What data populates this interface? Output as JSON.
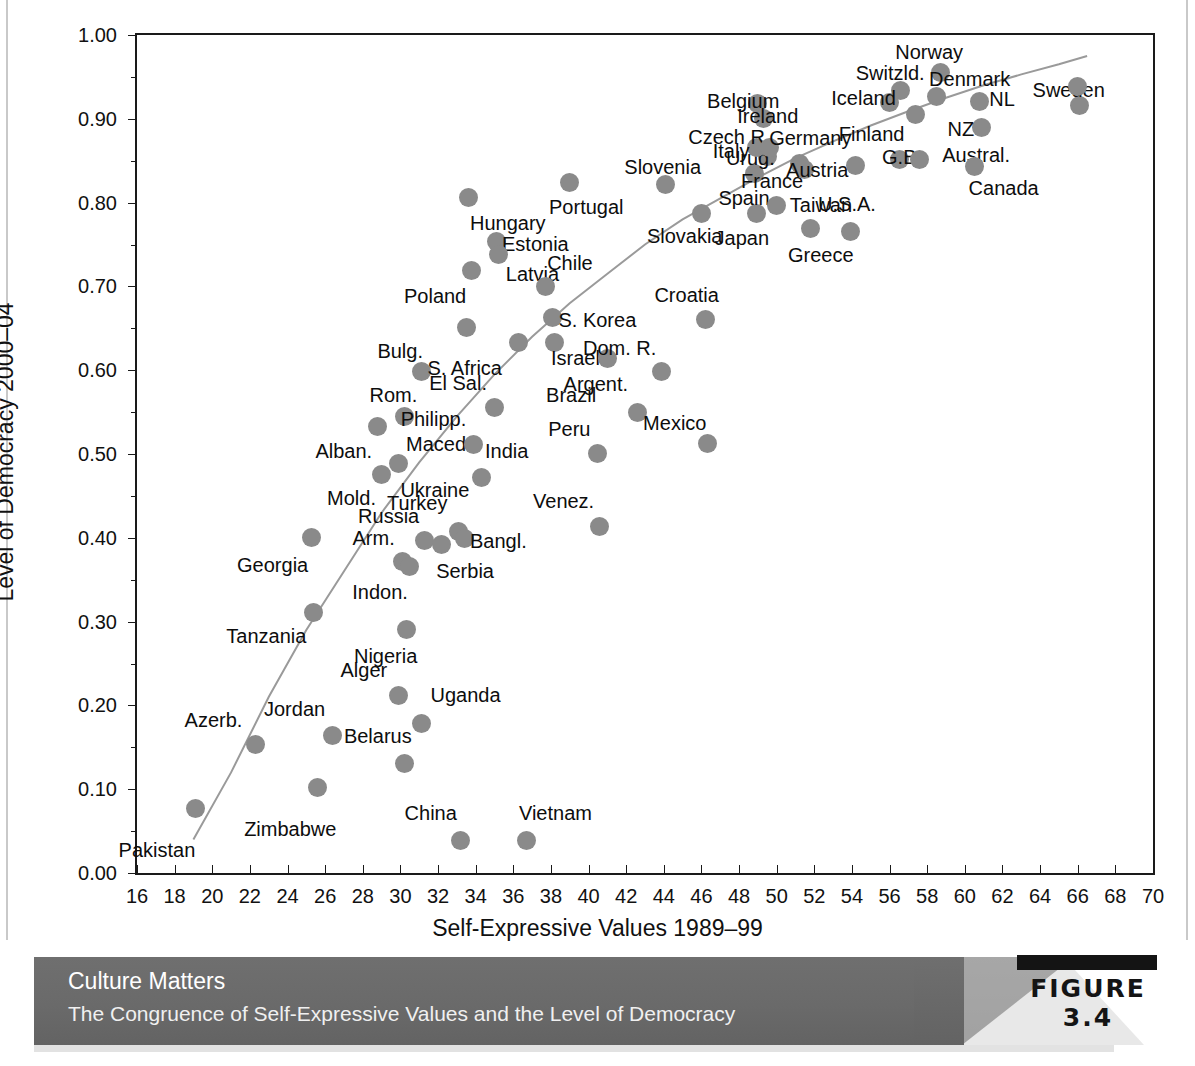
{
  "figure": {
    "tag_label": "FIGURE 3.4",
    "banner_title": "Culture Matters",
    "banner_subtitle": "The Congruence of Self-Expressive Values and the Level of Democracy"
  },
  "colors": {
    "marker": "#8a8a8a",
    "axis": "#1a1a1a",
    "trend": "#9a9a9a",
    "banner": "#6a6a6a",
    "banner_text": "#ffffff"
  },
  "chart_data": {
    "type": "scatter",
    "title": "The Congruence of Self-Expressive Values and the Level of Democracy",
    "xlabel": "Self-Expressive Values 1989–99",
    "ylabel": "Level of Democracy 2000–04",
    "xlim": [
      16,
      70
    ],
    "ylim": [
      0.0,
      1.0
    ],
    "grid": false,
    "legend": "none",
    "x_ticks": [
      16,
      18,
      20,
      22,
      24,
      26,
      28,
      30,
      32,
      34,
      36,
      38,
      40,
      42,
      44,
      46,
      48,
      50,
      52,
      54,
      56,
      58,
      60,
      62,
      64,
      66,
      68,
      70
    ],
    "x_tick_labels": [
      "16",
      "18",
      "20",
      "22",
      "24",
      "26",
      "28",
      "30",
      "32",
      "34",
      "36",
      "38",
      "40",
      "42",
      "44",
      "46",
      "48",
      "50",
      "52",
      "54",
      "56",
      "58",
      "60",
      "62",
      "64",
      "66",
      "68",
      "70"
    ],
    "y_ticks": [
      0.0,
      0.1,
      0.2,
      0.3,
      0.4,
      0.5,
      0.6,
      0.7,
      0.8,
      0.9,
      1.0
    ],
    "y_tick_labels": [
      "0.00",
      "0.10",
      "0.20",
      "0.30",
      "0.40",
      "0.50",
      "0.60",
      "0.70",
      "0.80",
      "0.90",
      "1.00"
    ],
    "y_minor_ticks": [
      0.05,
      0.15,
      0.25,
      0.35,
      0.45,
      0.55,
      0.65,
      0.75,
      0.85,
      0.95
    ],
    "trend_line": {
      "type": "logarithmic-fit",
      "points": [
        [
          19.0,
          0.04
        ],
        [
          21.0,
          0.12
        ],
        [
          23.0,
          0.21
        ],
        [
          25.0,
          0.29
        ],
        [
          27.0,
          0.36
        ],
        [
          29.0,
          0.43
        ],
        [
          31.0,
          0.49
        ],
        [
          33.0,
          0.545
        ],
        [
          35.0,
          0.595
        ],
        [
          37.0,
          0.64
        ],
        [
          39.0,
          0.68
        ],
        [
          41.0,
          0.715
        ],
        [
          43.0,
          0.75
        ],
        [
          45.0,
          0.78
        ],
        [
          47.0,
          0.805
        ],
        [
          49.0,
          0.83
        ],
        [
          51.0,
          0.853
        ],
        [
          53.0,
          0.873
        ],
        [
          55.0,
          0.892
        ],
        [
          57.0,
          0.909
        ],
        [
          59.0,
          0.925
        ],
        [
          61.0,
          0.94
        ],
        [
          63.0,
          0.953
        ],
        [
          65.0,
          0.965
        ],
        [
          66.5,
          0.975
        ]
      ]
    },
    "points": [
      {
        "label": "Pakistan",
        "x": 19.1,
        "y": 0.077,
        "lx": 19.1,
        "ly": 0.028,
        "anchor": "r"
      },
      {
        "label": "Azerb.",
        "x": 22.3,
        "y": 0.153,
        "lx": 21.6,
        "ly": 0.183,
        "anchor": "r"
      },
      {
        "label": "Tanzania",
        "x": 25.4,
        "y": 0.311,
        "lx": 25.0,
        "ly": 0.283,
        "anchor": "r"
      },
      {
        "label": "Zimbabwe",
        "x": 25.6,
        "y": 0.102,
        "lx": 26.6,
        "ly": 0.052,
        "anchor": "r"
      },
      {
        "label": "Jordan",
        "x": 26.4,
        "y": 0.164,
        "lx": 26.0,
        "ly": 0.196,
        "anchor": "r"
      },
      {
        "label": "Alger",
        "x": 29.9,
        "y": 0.212,
        "lx": 29.3,
        "ly": 0.242,
        "anchor": "r"
      },
      {
        "label": "Nigeria",
        "x": 30.3,
        "y": 0.291,
        "lx": 30.9,
        "ly": 0.259,
        "anchor": "r"
      },
      {
        "label": "Uganda",
        "x": 31.1,
        "y": 0.178,
        "lx": 31.6,
        "ly": 0.212,
        "anchor": "l"
      },
      {
        "label": "Belarus",
        "x": 30.2,
        "y": 0.131,
        "lx": 30.6,
        "ly": 0.163,
        "anchor": "r"
      },
      {
        "label": "China",
        "x": 33.2,
        "y": 0.039,
        "lx": 33.0,
        "ly": 0.072,
        "anchor": "r"
      },
      {
        "label": "Vietnam",
        "x": 36.7,
        "y": 0.039,
        "lx": 36.3,
        "ly": 0.072,
        "anchor": "l"
      },
      {
        "label": "Georgia",
        "x": 25.3,
        "y": 0.4,
        "lx": 25.1,
        "ly": 0.368,
        "anchor": "r"
      },
      {
        "label": "Alban.",
        "x": 28.8,
        "y": 0.533,
        "lx": 28.5,
        "ly": 0.503,
        "anchor": "r"
      },
      {
        "label": "Mold.",
        "x": 29.0,
        "y": 0.476,
        "lx": 28.7,
        "ly": 0.447,
        "anchor": "r"
      },
      {
        "label": "Maced.",
        "x": 30.2,
        "y": 0.545,
        "lx": 30.3,
        "ly": 0.512,
        "anchor": "l"
      },
      {
        "label": "Ukraine",
        "x": 29.9,
        "y": 0.489,
        "lx": 30.0,
        "ly": 0.457,
        "anchor": "l"
      },
      {
        "label": "Arm.",
        "x": 30.1,
        "y": 0.372,
        "lx": 29.7,
        "ly": 0.4,
        "anchor": "r"
      },
      {
        "label": "Russia",
        "x": 31.3,
        "y": 0.397,
        "lx": 31.0,
        "ly": 0.426,
        "anchor": "r"
      },
      {
        "label": "Indon.",
        "x": 30.5,
        "y": 0.366,
        "lx": 30.4,
        "ly": 0.335,
        "anchor": "r"
      },
      {
        "label": "Serbia",
        "x": 32.2,
        "y": 0.392,
        "lx": 31.9,
        "ly": 0.36,
        "anchor": "l"
      },
      {
        "label": "Turkey",
        "x": 33.1,
        "y": 0.408,
        "lx": 32.5,
        "ly": 0.441,
        "anchor": "r"
      },
      {
        "label": "Bangl.",
        "x": 33.4,
        "y": 0.399,
        "lx": 33.7,
        "ly": 0.396,
        "anchor": "l"
      },
      {
        "label": "Rom.",
        "x": 31.1,
        "y": 0.599,
        "lx": 30.9,
        "ly": 0.57,
        "anchor": "r"
      },
      {
        "label": "Bulg.",
        "x": 33.5,
        "y": 0.651,
        "lx": 31.2,
        "ly": 0.623,
        "anchor": "r"
      },
      {
        "label": "Philipp.",
        "x": 33.9,
        "y": 0.511,
        "lx": 33.5,
        "ly": 0.542,
        "anchor": "r"
      },
      {
        "label": "India",
        "x": 34.3,
        "y": 0.472,
        "lx": 34.5,
        "ly": 0.503,
        "anchor": "l"
      },
      {
        "label": "El Sal.",
        "x": 35.0,
        "y": 0.555,
        "lx": 34.6,
        "ly": 0.585,
        "anchor": "r"
      },
      {
        "label": "S. Africa",
        "x": 36.3,
        "y": 0.633,
        "lx": 35.4,
        "ly": 0.603,
        "anchor": "r"
      },
      {
        "label": "Hungary",
        "x": 33.6,
        "y": 0.806,
        "lx": 33.7,
        "ly": 0.776,
        "anchor": "l"
      },
      {
        "label": "Poland",
        "x": 33.8,
        "y": 0.719,
        "lx": 33.5,
        "ly": 0.688,
        "anchor": "r"
      },
      {
        "label": "Estonia",
        "x": 35.1,
        "y": 0.753,
        "lx": 35.4,
        "ly": 0.751,
        "anchor": "l"
      },
      {
        "label": "Latvia",
        "x": 35.2,
        "y": 0.738,
        "lx": 35.6,
        "ly": 0.715,
        "anchor": "l"
      },
      {
        "label": "Portugal",
        "x": 39.0,
        "y": 0.824,
        "lx": 37.9,
        "ly": 0.795,
        "anchor": "l"
      },
      {
        "label": "Chile",
        "x": 37.7,
        "y": 0.7,
        "lx": 37.8,
        "ly": 0.728,
        "anchor": "l"
      },
      {
        "label": "S. Korea",
        "x": 38.1,
        "y": 0.663,
        "lx": 38.4,
        "ly": 0.66,
        "anchor": "l"
      },
      {
        "label": "Israel",
        "x": 38.2,
        "y": 0.633,
        "lx": 38.0,
        "ly": 0.615,
        "anchor": "l"
      },
      {
        "label": "Peru",
        "x": 40.5,
        "y": 0.501,
        "lx": 40.1,
        "ly": 0.53,
        "anchor": "r"
      },
      {
        "label": "Brazil",
        "x": 41.0,
        "y": 0.614,
        "lx": 40.4,
        "ly": 0.57,
        "anchor": "r"
      },
      {
        "label": "Venez.",
        "x": 40.6,
        "y": 0.414,
        "lx": 40.3,
        "ly": 0.444,
        "anchor": "r"
      },
      {
        "label": "Argent.",
        "x": 42.6,
        "y": 0.549,
        "lx": 42.1,
        "ly": 0.583,
        "anchor": "r"
      },
      {
        "label": "Dom. R.",
        "x": 43.9,
        "y": 0.598,
        "lx": 43.6,
        "ly": 0.627,
        "anchor": "r"
      },
      {
        "label": "Mexico",
        "x": 46.3,
        "y": 0.512,
        "lx": 42.9,
        "ly": 0.537,
        "anchor": "l"
      },
      {
        "label": "Croatia",
        "x": 46.2,
        "y": 0.661,
        "lx": 43.5,
        "ly": 0.69,
        "anchor": "l"
      },
      {
        "label": "Slovenia",
        "x": 44.1,
        "y": 0.822,
        "lx": 41.9,
        "ly": 0.842,
        "anchor": "l"
      },
      {
        "label": "Slovakia",
        "x": 46.0,
        "y": 0.787,
        "lx": 43.1,
        "ly": 0.76,
        "anchor": "l"
      },
      {
        "label": "Japan",
        "x": 48.9,
        "y": 0.787,
        "lx": 46.7,
        "ly": 0.758,
        "anchor": "l"
      },
      {
        "label": "Spain",
        "x": 48.8,
        "y": 0.835,
        "lx": 46.9,
        "ly": 0.806,
        "anchor": "l"
      },
      {
        "label": "Urug.",
        "x": 49.5,
        "y": 0.855,
        "lx": 47.3,
        "ly": 0.853,
        "anchor": "l"
      },
      {
        "label": "Czech R.",
        "x": 48.9,
        "y": 0.866,
        "lx": 45.3,
        "ly": 0.878,
        "anchor": "l"
      },
      {
        "label": "Italy",
        "x": 49.6,
        "y": 0.866,
        "lx": 46.6,
        "ly": 0.861,
        "anchor": "l"
      },
      {
        "label": "Belgium",
        "x": 49.0,
        "y": 0.918,
        "lx": 46.3,
        "ly": 0.921,
        "anchor": "l"
      },
      {
        "label": "Ireland",
        "x": 49.3,
        "y": 0.9,
        "lx": 47.9,
        "ly": 0.903,
        "anchor": "l"
      },
      {
        "label": "France",
        "x": 50.0,
        "y": 0.796,
        "lx": 48.1,
        "ly": 0.826,
        "anchor": "l"
      },
      {
        "label": "Germany",
        "x": 51.2,
        "y": 0.847,
        "lx": 49.6,
        "ly": 0.877,
        "anchor": "l"
      },
      {
        "label": "Austria",
        "x": 51.5,
        "y": 0.84,
        "lx": 50.5,
        "ly": 0.839,
        "anchor": "l"
      },
      {
        "label": "Taiwan",
        "x": 51.8,
        "y": 0.769,
        "lx": 50.7,
        "ly": 0.797,
        "anchor": "l"
      },
      {
        "label": "Greece",
        "x": 53.9,
        "y": 0.765,
        "lx": 50.6,
        "ly": 0.738,
        "anchor": "l"
      },
      {
        "label": "Switzld.",
        "x": 56.6,
        "y": 0.934,
        "lx": 54.2,
        "ly": 0.955,
        "anchor": "l"
      },
      {
        "label": "Iceland",
        "x": 56.0,
        "y": 0.92,
        "lx": 52.9,
        "ly": 0.925,
        "anchor": "l"
      },
      {
        "label": "Finland",
        "x": 57.4,
        "y": 0.905,
        "lx": 53.3,
        "ly": 0.882,
        "anchor": "l"
      },
      {
        "label": "Norway",
        "x": 58.7,
        "y": 0.955,
        "lx": 56.3,
        "ly": 0.98,
        "anchor": "l"
      },
      {
        "label": "Denmark",
        "x": 58.5,
        "y": 0.927,
        "lx": 58.1,
        "ly": 0.947,
        "anchor": "l"
      },
      {
        "label": "U.S.A.",
        "x": 54.2,
        "y": 0.844,
        "lx": 52.2,
        "ly": 0.798,
        "anchor": "l"
      },
      {
        "label": "G.B.",
        "x": 56.5,
        "y": 0.852,
        "lx": 55.6,
        "ly": 0.855,
        "anchor": "l"
      },
      {
        "label": "Austral.",
        "x": 57.6,
        "y": 0.852,
        "lx": 58.8,
        "ly": 0.857,
        "anchor": "l"
      },
      {
        "label": "Canada",
        "x": 60.5,
        "y": 0.843,
        "lx": 60.2,
        "ly": 0.817,
        "anchor": "l"
      },
      {
        "label": "NL",
        "x": 60.8,
        "y": 0.921,
        "lx": 61.3,
        "ly": 0.924,
        "anchor": "l"
      },
      {
        "label": "NZ",
        "x": 60.9,
        "y": 0.89,
        "lx": 60.5,
        "ly": 0.888,
        "anchor": "r"
      },
      {
        "label": "Sweden",
        "x": 66.1,
        "y": 0.916,
        "lx": 63.6,
        "ly": 0.934,
        "anchor": "l"
      },
      {
        "label": "Sweden2",
        "x": 66.0,
        "y": 0.938,
        "lx": 66.0,
        "ly": 0.938,
        "anchor": "hide"
      }
    ]
  }
}
